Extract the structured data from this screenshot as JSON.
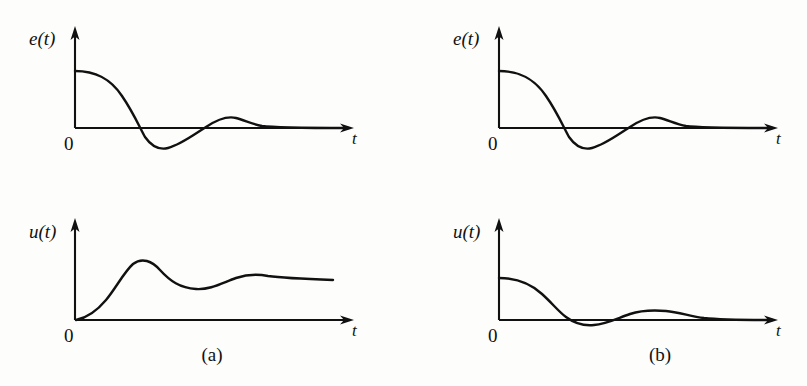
{
  "figure": {
    "background_color": "#fdfdfc",
    "ink_color": "#111111",
    "panels": [
      {
        "id": "panel-a",
        "caption": "(a)",
        "caption_x": 212,
        "caption_y": 361,
        "subplots": [
          {
            "id": "a-error",
            "y_label": "e(t)",
            "x_label": "t",
            "origin_label": "0",
            "y_label_x": 29,
            "y_label_y": 45,
            "origin_label_x": 64,
            "origin_label_y": 150,
            "x_label_x": 352,
            "x_label_y": 144,
            "axis": {
              "origin_x": 75,
              "baseline_y": 128,
              "x_axis_end": 352,
              "y_axis_top": 30
            },
            "curve_description": "damped oscillation decaying from positive initial error through undershoot to zero",
            "curve_path": "M 75 71 C 95 71 110 78 122 96 C 133 112 139 126 145 137 C 152 147 160 150 168 148 C 180 145 192 136 206 127 C 218 119 228 116 236 118 C 244 120 252 124 262 126 C 275 128 300 128 348 128"
          },
          {
            "id": "a-control",
            "y_label": "u(t)",
            "x_label": "t",
            "origin_label": "0",
            "y_label_x": 29,
            "y_label_y": 238,
            "origin_label_x": 64,
            "origin_label_y": 342,
            "x_label_x": 352,
            "x_label_y": 336,
            "axis": {
              "origin_x": 75,
              "baseline_y": 320,
              "x_axis_end": 352,
              "y_axis_top": 222
            },
            "curve_description": "control effort rising from zero to an overshoot peak then settling with a mild second hump",
            "curve_path": "M 76 320 C 86 318 96 312 106 300 C 116 288 124 272 133 264 C 142 257 152 261 160 270 C 170 281 180 288 196 289 C 210 290 222 283 236 278 C 248 274 258 274 268 276 C 282 278 305 279 333 280"
          }
        ]
      },
      {
        "id": "panel-b",
        "caption": "(b)",
        "caption_x": 660,
        "caption_y": 361,
        "subplots": [
          {
            "id": "b-error",
            "y_label": "e(t)",
            "x_label": "t",
            "origin_label": "0",
            "y_label_x": 453,
            "y_label_y": 45,
            "origin_label_x": 488,
            "origin_label_y": 150,
            "x_label_x": 776,
            "x_label_y": 144,
            "axis": {
              "origin_x": 499,
              "baseline_y": 128,
              "x_axis_end": 776,
              "y_axis_top": 30
            },
            "curve_description": "damped oscillation decaying from positive initial error through undershoot to zero",
            "curve_path": "M 499 71 C 519 71 534 78 546 96 C 557 112 563 126 569 137 C 576 147 584 150 592 148 C 604 145 616 136 630 127 C 642 119 652 116 660 118 C 668 120 676 124 686 126 C 699 128 724 128 772 128"
          },
          {
            "id": "b-control",
            "y_label": "u(t)",
            "x_label": "t",
            "origin_label": "0",
            "y_label_x": 453,
            "y_label_y": 238,
            "origin_label_x": 488,
            "origin_label_y": 342,
            "x_label_x": 776,
            "x_label_y": 336,
            "axis": {
              "origin_x": 499,
              "baseline_y": 320,
              "x_axis_end": 776,
              "y_axis_top": 222
            },
            "curve_description": "control effort decaying from a positive initial value with a shallow undershoot and small ripple",
            "curve_path": "M 499 278 C 517 278 530 283 542 294 C 552 303 559 312 566 317 C 574 323 584 326 594 325 C 606 324 618 318 630 314 C 642 310 654 310 666 311 C 678 312 690 316 704 318 C 722 320 744 320 772 320"
          }
        ]
      }
    ]
  }
}
